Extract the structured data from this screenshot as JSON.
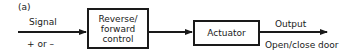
{
  "figure": {
    "label": "(a)"
  },
  "input": {
    "label": "Signal",
    "sublabel": "+ or –"
  },
  "blocks": [
    {
      "id": "control",
      "lines": [
        "Reverse/",
        "forward",
        "control"
      ]
    },
    {
      "id": "actuator",
      "lines": [
        "Actuator"
      ]
    }
  ],
  "output": {
    "label": "Output",
    "sublabel": "Open/close door"
  }
}
